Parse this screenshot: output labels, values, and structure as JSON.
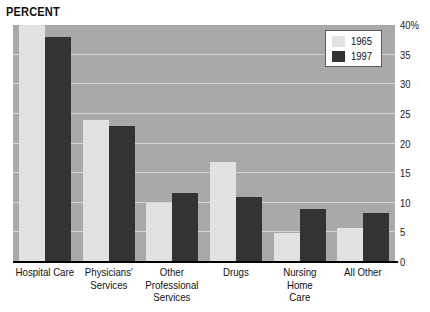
{
  "chart_data": {
    "type": "bar",
    "title": "PERCENT",
    "xlabel": "",
    "ylabel": "PERCENT",
    "ylim": [
      0,
      40
    ],
    "yticks": [
      40,
      35,
      30,
      25,
      20,
      15,
      10,
      5,
      0
    ],
    "ytick_labels": [
      "40%",
      "35",
      "30",
      "25",
      "20",
      "15",
      "10",
      "5",
      "0"
    ],
    "grid": true,
    "legend_position": "top-right",
    "categories": [
      "Hospital Care",
      "Physicians' Services",
      "Other Professional Services",
      "Drugs",
      "Nursing Home Care",
      "All Other"
    ],
    "category_lines": [
      [
        "Hospital Care"
      ],
      [
        "Physicians'",
        "Services"
      ],
      [
        "Other Professional",
        "Services"
      ],
      [
        "Drugs"
      ],
      [
        "Nursing Home",
        "Care"
      ],
      [
        "All Other"
      ]
    ],
    "series": [
      {
        "name": "1965",
        "color": "#e2e2e2",
        "values": [
          40.0,
          24.0,
          10.0,
          16.8,
          4.9,
          5.7
        ]
      },
      {
        "name": "1997",
        "color": "#333333",
        "values": [
          38.0,
          23.0,
          11.7,
          11.0,
          9.0,
          8.2
        ]
      }
    ]
  },
  "legend": {
    "items": [
      {
        "label": "1965",
        "color": "#e2e2e2"
      },
      {
        "label": "1997",
        "color": "#333333"
      }
    ]
  },
  "colors": {
    "plot_background": "#a9a9a9",
    "gridline": "#d5d5d5",
    "axis": "#000000",
    "series_1965": "#e2e2e2",
    "series_1997": "#333333",
    "page_background": "#ffffff"
  }
}
